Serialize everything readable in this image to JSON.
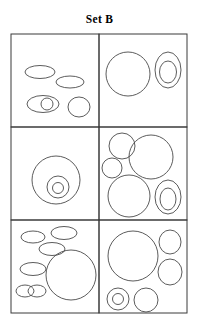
{
  "figure": {
    "title": "Set B",
    "width": 199,
    "height": 324,
    "stroke_color": "#4a4a4a",
    "border_color": "#3a3a3a",
    "background_color": "#ffffff"
  },
  "grid": {
    "left": 11,
    "top": 34,
    "right": 187,
    "bottom": 313,
    "col_divider_x": 99,
    "row_divider_y": [
      127,
      220
    ],
    "rows": 3,
    "columns": 2
  },
  "cells": [
    {
      "name": "cell-top-left",
      "row": 1,
      "column": 1,
      "shape_count": 5,
      "shapes": [
        {
          "name": "ellipse-flat-upper-left",
          "type": "ellipse",
          "cx": 40,
          "cy": 72,
          "rx": 15,
          "ry": 6.5
        },
        {
          "name": "ellipse-flat-upper-right",
          "type": "ellipse",
          "cx": 70,
          "cy": 82,
          "rx": 14,
          "ry": 6
        },
        {
          "name": "ellipse-lower-left-outer",
          "type": "ellipse",
          "cx": 43,
          "cy": 104,
          "rx": 16,
          "ry": 8.5
        },
        {
          "name": "circle-inside-lower-left-ellipse",
          "type": "circle",
          "cx": 47,
          "cy": 104,
          "rx": 6,
          "ry": 6
        },
        {
          "name": "ellipse-round-lower-right",
          "type": "ellipse",
          "cx": 79,
          "cy": 107,
          "rx": 11,
          "ry": 10
        }
      ]
    },
    {
      "name": "cell-top-right",
      "row": 1,
      "column": 2,
      "shape_count": 3,
      "shapes": [
        {
          "name": "circle-large-left",
          "type": "circle",
          "cx": 128,
          "cy": 74,
          "rx": 22,
          "ry": 22
        },
        {
          "name": "ellipse-tall-right-outer",
          "type": "ellipse",
          "cx": 168,
          "cy": 70,
          "rx": 13,
          "ry": 18
        },
        {
          "name": "ellipse-tall-right-inner",
          "type": "ellipse",
          "cx": 168,
          "cy": 72,
          "rx": 8.5,
          "ry": 11
        }
      ]
    },
    {
      "name": "cell-middle-left",
      "row": 2,
      "column": 1,
      "shape_count": 3,
      "shapes": [
        {
          "name": "circle-concentric-outer",
          "type": "circle",
          "cx": 56,
          "cy": 180,
          "rx": 24,
          "ry": 24
        },
        {
          "name": "circle-concentric-middle",
          "type": "circle",
          "cx": 58,
          "cy": 187,
          "rx": 11,
          "ry": 11
        },
        {
          "name": "circle-concentric-inner",
          "type": "circle",
          "cx": 58,
          "cy": 188,
          "rx": 5.5,
          "ry": 5.5
        }
      ]
    },
    {
      "name": "cell-middle-right",
      "row": 2,
      "column": 2,
      "shape_count": 6,
      "shapes": [
        {
          "name": "circle-medium-top-left",
          "type": "circle",
          "cx": 122,
          "cy": 146,
          "rx": 13,
          "ry": 13
        },
        {
          "name": "circle-small-left",
          "type": "circle",
          "cx": 112,
          "cy": 168,
          "rx": 10,
          "ry": 10
        },
        {
          "name": "circle-large-top-right",
          "type": "circle",
          "cx": 151,
          "cy": 157,
          "rx": 22,
          "ry": 22
        },
        {
          "name": "circle-large-bottom-left",
          "type": "circle",
          "cx": 129,
          "cy": 196,
          "rx": 21,
          "ry": 21
        },
        {
          "name": "ellipse-bottom-right-outer",
          "type": "ellipse",
          "cx": 168,
          "cy": 197,
          "rx": 13,
          "ry": 17
        },
        {
          "name": "ellipse-bottom-right-inner",
          "type": "ellipse",
          "cx": 168,
          "cy": 199,
          "rx": 8,
          "ry": 11
        }
      ]
    },
    {
      "name": "cell-bottom-left",
      "row": 3,
      "column": 1,
      "shape_count": 7,
      "shapes": [
        {
          "name": "ellipse-flat-top-left",
          "type": "ellipse",
          "cx": 33,
          "cy": 237,
          "rx": 12,
          "ry": 6
        },
        {
          "name": "ellipse-flat-top-right",
          "type": "ellipse",
          "cx": 64,
          "cy": 233,
          "rx": 13,
          "ry": 6.5
        },
        {
          "name": "ellipse-flat-upper-middle",
          "type": "ellipse",
          "cx": 52,
          "cy": 249,
          "rx": 13,
          "ry": 6.5
        },
        {
          "name": "ellipse-flat-mid-left",
          "type": "ellipse",
          "cx": 33,
          "cy": 269,
          "rx": 13,
          "ry": 6.5
        },
        {
          "name": "ellipse-overlap-left",
          "type": "ellipse",
          "cx": 25,
          "cy": 291,
          "rx": 9,
          "ry": 6
        },
        {
          "name": "ellipse-overlap-right",
          "type": "ellipse",
          "cx": 37,
          "cy": 291,
          "rx": 9,
          "ry": 6
        },
        {
          "name": "circle-large-bottom-right",
          "type": "circle",
          "cx": 71,
          "cy": 275,
          "rx": 25,
          "ry": 25
        }
      ]
    },
    {
      "name": "cell-bottom-right",
      "row": 3,
      "column": 2,
      "shape_count": 6,
      "shapes": [
        {
          "name": "circle-large-top-left",
          "type": "circle",
          "cx": 133,
          "cy": 256,
          "rx": 25,
          "ry": 25
        },
        {
          "name": "ellipse-right-upper",
          "type": "ellipse",
          "cx": 170,
          "cy": 242,
          "rx": 11,
          "ry": 12
        },
        {
          "name": "ellipse-right-lower",
          "type": "ellipse",
          "cx": 170,
          "cy": 272,
          "rx": 12,
          "ry": 13
        },
        {
          "name": "circle-donut-outer",
          "type": "circle",
          "cx": 118,
          "cy": 299,
          "rx": 11,
          "ry": 11
        },
        {
          "name": "circle-donut-inner",
          "type": "circle",
          "cx": 118,
          "cy": 299,
          "rx": 5.5,
          "ry": 5.5
        },
        {
          "name": "circle-bottom-center",
          "type": "circle",
          "cx": 146,
          "cy": 300,
          "rx": 12,
          "ry": 12
        }
      ]
    }
  ]
}
